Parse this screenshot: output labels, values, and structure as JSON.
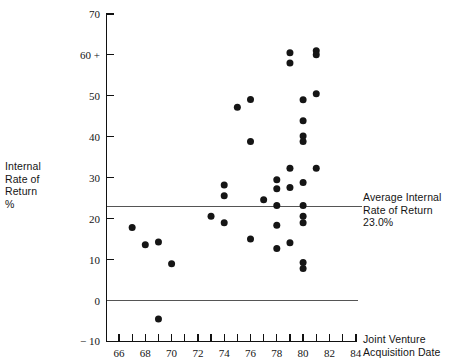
{
  "chart_data": {
    "type": "scatter",
    "title": "",
    "xlabel": "Joint Venture Acquisition Date",
    "ylabel": "Internal Rate of Return %",
    "xlim": [
      65,
      84
    ],
    "ylim": [
      -10,
      70
    ],
    "grid": false,
    "legend": "none",
    "x_ticks": [
      66,
      67,
      68,
      69,
      70,
      71,
      72,
      73,
      74,
      75,
      76,
      77,
      78,
      79,
      80,
      81,
      82,
      83,
      84
    ],
    "x_tick_labels": [
      "66",
      "",
      "68",
      "",
      "70",
      "",
      "72",
      "",
      "74",
      "",
      "76",
      "",
      "78",
      "",
      "80",
      "",
      "82",
      "",
      "84"
    ],
    "y_ticks": [
      -10,
      0,
      10,
      20,
      30,
      40,
      50,
      60,
      70
    ],
    "y_tick_labels": [
      "− 10",
      "0",
      "10",
      "20",
      "30",
      "40",
      "50",
      "60 +",
      "70"
    ],
    "reference_lines": [
      {
        "name": "average-internal-rate-of-return",
        "y": 23.0,
        "label": "Average Internal\nRate of Return\n23.0%"
      },
      {
        "name": "zero-line",
        "y": 0.0,
        "label": ""
      }
    ],
    "points": [
      {
        "x": 67.0,
        "y": 17.8
      },
      {
        "x": 68.0,
        "y": 13.6
      },
      {
        "x": 69.0,
        "y": 14.3
      },
      {
        "x": 70.0,
        "y": 9.0
      },
      {
        "x": 69.0,
        "y": -4.5
      },
      {
        "x": 73.0,
        "y": 20.6
      },
      {
        "x": 74.0,
        "y": 28.2
      },
      {
        "x": 74.0,
        "y": 25.6
      },
      {
        "x": 74.0,
        "y": 19.0
      },
      {
        "x": 75.0,
        "y": 47.2
      },
      {
        "x": 76.0,
        "y": 49.1
      },
      {
        "x": 76.0,
        "y": 38.8
      },
      {
        "x": 76.0,
        "y": 15.0
      },
      {
        "x": 77.0,
        "y": 24.6
      },
      {
        "x": 78.0,
        "y": 29.5
      },
      {
        "x": 78.0,
        "y": 27.3
      },
      {
        "x": 78.0,
        "y": 23.2
      },
      {
        "x": 78.0,
        "y": 18.4
      },
      {
        "x": 78.0,
        "y": 12.7
      },
      {
        "x": 79.0,
        "y": 60.5
      },
      {
        "x": 79.0,
        "y": 58.0
      },
      {
        "x": 79.0,
        "y": 32.3
      },
      {
        "x": 79.0,
        "y": 27.6
      },
      {
        "x": 79.0,
        "y": 14.1
      },
      {
        "x": 80.0,
        "y": 49.0
      },
      {
        "x": 80.0,
        "y": 43.9
      },
      {
        "x": 80.0,
        "y": 40.2
      },
      {
        "x": 80.0,
        "y": 38.8
      },
      {
        "x": 80.0,
        "y": 28.8
      },
      {
        "x": 80.0,
        "y": 23.2
      },
      {
        "x": 80.0,
        "y": 20.6
      },
      {
        "x": 80.0,
        "y": 19.0
      },
      {
        "x": 80.0,
        "y": 9.3
      },
      {
        "x": 80.0,
        "y": 7.8
      },
      {
        "x": 81.0,
        "y": 61.0
      },
      {
        "x": 81.0,
        "y": 60.0
      },
      {
        "x": 81.0,
        "y": 50.5
      },
      {
        "x": 81.0,
        "y": 32.3
      }
    ],
    "point_count": 38,
    "marker": "filled-circle",
    "marker_color": "#151515",
    "marker_size_px": 7
  },
  "labels": {
    "y_axis_title": "Internal\nRate of\nReturn\n%",
    "x_axis_title": "Joint Venture\nAcquisition Date",
    "average_annotation": "Average Internal\nRate of Return\n23.0%"
  },
  "colors": {
    "axis": "#111111",
    "marker": "#151515",
    "reference_line": "#555555",
    "text": "#141414",
    "background": "#ffffff"
  }
}
